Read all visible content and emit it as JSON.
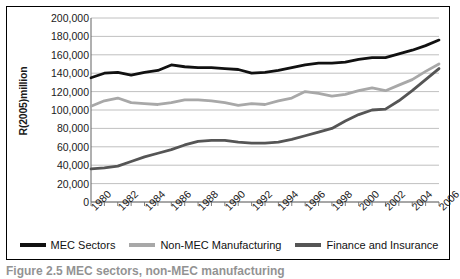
{
  "figure": {
    "caption_fragment": "Figure 2.5 MEC sectors, non-MEC manufacturing"
  },
  "chart_data": {
    "type": "line",
    "title": "",
    "xlabel": "",
    "ylabel": "R(2005)million",
    "ylim": [
      0,
      200000
    ],
    "xlim": [
      1980,
      2006
    ],
    "grid": true,
    "legend_position": "bottom",
    "y_ticks": [
      "0",
      "20,000",
      "40,000",
      "60,000",
      "80,000",
      "100,000",
      "120,000",
      "140,000",
      "160,000",
      "180,000",
      "200,000"
    ],
    "y_tick_values": [
      0,
      20000,
      40000,
      60000,
      80000,
      100000,
      120000,
      140000,
      160000,
      180000,
      200000
    ],
    "x": [
      1980,
      1981,
      1982,
      1983,
      1984,
      1985,
      1986,
      1987,
      1988,
      1989,
      1990,
      1991,
      1992,
      1993,
      1994,
      1995,
      1996,
      1997,
      1998,
      1999,
      2000,
      2001,
      2002,
      2003,
      2004,
      2005,
      2006
    ],
    "x_tick_labels": [
      "1980",
      "1982",
      "1984",
      "1986",
      "1988",
      "1990",
      "1992",
      "1994",
      "1996",
      "1998",
      "2000",
      "2002",
      "2004",
      "2006"
    ],
    "x_tick_values": [
      1980,
      1982,
      1984,
      1986,
      1988,
      1990,
      1992,
      1994,
      1996,
      1998,
      2000,
      2002,
      2004,
      2006
    ],
    "series": [
      {
        "name": "MEC Sectors",
        "color": "#111111",
        "width": 2.8,
        "values": [
          135000,
          140000,
          141000,
          138000,
          141000,
          143000,
          149000,
          147000,
          146000,
          146000,
          145000,
          144000,
          140000,
          141000,
          143000,
          146000,
          149000,
          151000,
          151000,
          152000,
          155000,
          157000,
          157000,
          161000,
          165000,
          170000,
          176000
        ]
      },
      {
        "name": "Non-MEC Manufacturing",
        "color": "#a8a8a8",
        "width": 2.8,
        "values": [
          104000,
          110000,
          113000,
          108000,
          107000,
          106000,
          108000,
          111000,
          111000,
          110000,
          108000,
          105000,
          107000,
          106000,
          110000,
          113000,
          120000,
          118000,
          115000,
          117000,
          121000,
          124000,
          121000,
          127000,
          133000,
          142000,
          150000
        ]
      },
      {
        "name": "Finance and Insurance",
        "color": "#555555",
        "width": 2.8,
        "values": [
          36000,
          37000,
          39000,
          44000,
          49000,
          53000,
          57000,
          62000,
          66000,
          67000,
          67000,
          65000,
          64000,
          64000,
          65000,
          68000,
          72000,
          76000,
          80000,
          88000,
          95000,
          100000,
          101000,
          110000,
          121000,
          133000,
          145000
        ]
      }
    ]
  },
  "legend": {
    "items": [
      {
        "label": "MEC Sectors",
        "color": "#111111"
      },
      {
        "label": "Non-MEC Manufacturing",
        "color": "#a8a8a8"
      },
      {
        "label": "Finance and Insurance",
        "color": "#555555"
      }
    ]
  }
}
